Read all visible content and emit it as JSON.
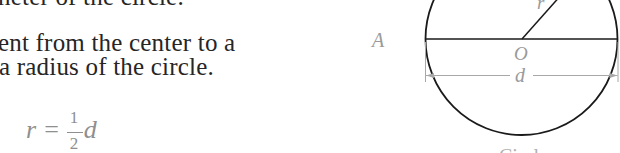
{
  "document": {
    "text_lines": [
      "neter of the circle.",
      "ent from the center to a",
      "a radius of the circle."
    ],
    "formula": {
      "lhs": "r",
      "equals": "=",
      "numerator": "1",
      "denominator": "2",
      "rhs_var": "d"
    }
  },
  "figure": {
    "labels": {
      "point_a": "A",
      "center": "O",
      "radius": "r",
      "diameter": "d"
    },
    "caption": "Circle",
    "colors": {
      "stroke": "#1a1a1a",
      "label": "#9a9a9a",
      "dimension_line": "#a8a8a8"
    }
  }
}
